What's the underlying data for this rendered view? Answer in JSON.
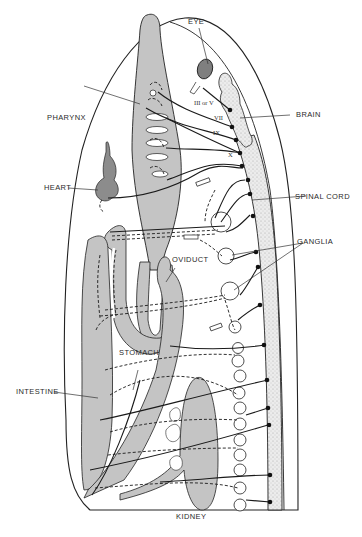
{
  "diagram": {
    "labels": {
      "eye": "EYE",
      "brain": "BRAIN",
      "pharynx": "PHARYNX",
      "heart": "HEART",
      "spinal_cord": "SPINAL CORD",
      "ganglia": "GANGLIA",
      "oviduct": "OVIDUCT",
      "stomach": "STOMACH",
      "intestine": "INTESTINE",
      "kidney": "KIDNEY"
    },
    "cranial_nerves": {
      "III_or_V": "III or V",
      "VII": "VII",
      "IX": "IX",
      "X": "X"
    },
    "colors": {
      "organ_fill": "#c4c4c4",
      "eye_fill": "#7f7f7f",
      "heart_fill": "#8c8c8c",
      "cord_fill": "#e4e4e4",
      "line": "#1a1a1a",
      "background": "#ffffff"
    }
  }
}
